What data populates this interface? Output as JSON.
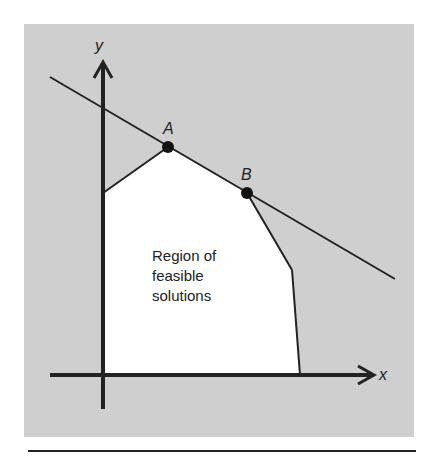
{
  "diagram": {
    "axes": {
      "x_label": "x",
      "y_label": "y"
    },
    "points": [
      {
        "label": "A",
        "x": 168,
        "y": 147
      },
      {
        "label": "B",
        "x": 247,
        "y": 193
      }
    ],
    "region_label": [
      "Region of",
      "feasible",
      "solutions"
    ],
    "colors": {
      "background": "#cfcfcf",
      "region": "#ffffff",
      "lines": "#222222"
    }
  }
}
